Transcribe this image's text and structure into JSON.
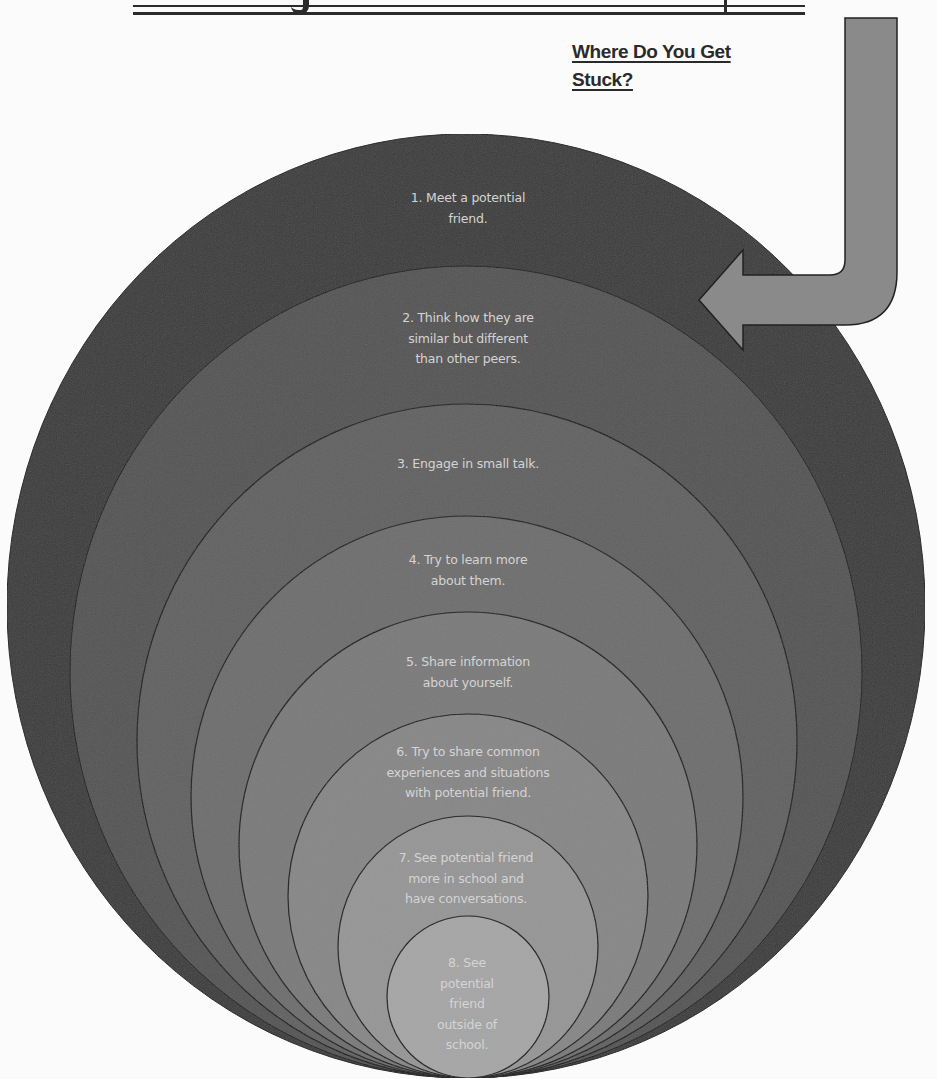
{
  "page": {
    "title_partial": "Get your friends map",
    "stuck_heading_line1": "Where Do You Get",
    "stuck_heading_line2": "Stuck?"
  },
  "colors": {
    "background": "#fbfbfb",
    "ring_fills": [
      "#3d3d3d",
      "#555555",
      "#626262",
      "#6e6e6e",
      "#7a7a7a",
      "#878787",
      "#969696",
      "#a6a6a6"
    ],
    "ring_outline": "#1e1e1e",
    "label_text": "#d4d4d4",
    "arrow_fill": "#8a8a8a",
    "arrow_outline": "#222222"
  },
  "rings": [
    {
      "step": 1,
      "lines": [
        "1. Meet a potential",
        "friend."
      ]
    },
    {
      "step": 2,
      "lines": [
        "2. Think how they are",
        "similar but different",
        "than other peers."
      ]
    },
    {
      "step": 3,
      "lines": [
        "3. Engage in small talk."
      ]
    },
    {
      "step": 4,
      "lines": [
        "4. Try to learn more",
        "about them."
      ]
    },
    {
      "step": 5,
      "lines": [
        "5. Share information",
        "about yourself."
      ]
    },
    {
      "step": 6,
      "lines": [
        "6. Try to share common",
        "experiences and situations",
        "with potential friend."
      ]
    },
    {
      "step": 7,
      "lines": [
        "7.  See potential friend",
        "more in school and",
        "have conversations."
      ]
    },
    {
      "step": 8,
      "lines": [
        "8. See",
        "potential",
        "friend",
        "outside of",
        "school."
      ]
    }
  ],
  "arrow": {
    "icon": "curved-arrow-left-icon",
    "points_to": "ring 2"
  }
}
